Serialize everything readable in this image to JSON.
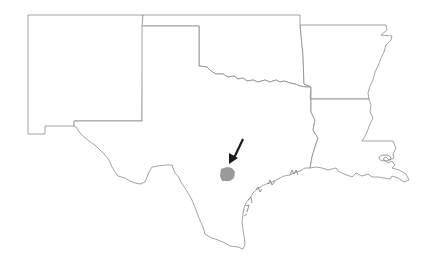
{
  "map": {
    "type": "regional-locator-map",
    "states": [
      {
        "name": "New Mexico"
      },
      {
        "name": "Oklahoma"
      },
      {
        "name": "Texas"
      },
      {
        "name": "Arkansas"
      },
      {
        "name": "Louisiana"
      }
    ],
    "highlight": {
      "feature": "county",
      "fill_color": "#9a9a9a"
    },
    "arrow": {
      "color": "#1a1a1a",
      "direction": "pointing-down-left"
    },
    "colors": {
      "background": "#ffffff",
      "border": "#8a8a8a"
    }
  }
}
